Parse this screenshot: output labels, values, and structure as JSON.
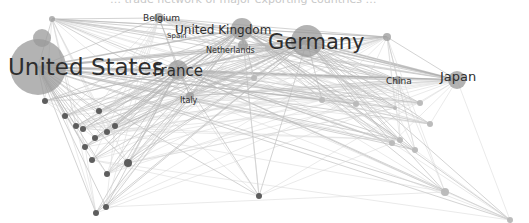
{
  "title_fragment": "… trade network of major exporting countries …",
  "colors": {
    "edge": "#b5b5b5",
    "node_major": "#9a9a9a",
    "node_dark": "#555555",
    "node_light": "#b8b8b8",
    "label": "#2e2e2e"
  },
  "labels": [
    {
      "id": "united-states",
      "text": "United States",
      "x": 8,
      "y": 56,
      "size": 23
    },
    {
      "id": "germany",
      "text": "Germany",
      "x": 268,
      "y": 32,
      "size": 21
    },
    {
      "id": "france",
      "text": "France",
      "x": 153,
      "y": 64,
      "size": 15
    },
    {
      "id": "united-kingdom",
      "text": "United Kingdom",
      "x": 175,
      "y": 24,
      "size": 12
    },
    {
      "id": "japan",
      "text": "Japan",
      "x": 440,
      "y": 70,
      "size": 13
    },
    {
      "id": "belgium",
      "text": "Belgium",
      "x": 143,
      "y": 14,
      "size": 9
    },
    {
      "id": "spain",
      "text": "Spain",
      "x": 167,
      "y": 33,
      "size": 7
    },
    {
      "id": "netherlands",
      "text": "Netherlands",
      "x": 206,
      "y": 47,
      "size": 8
    },
    {
      "id": "china",
      "text": "China",
      "x": 386,
      "y": 77,
      "size": 9
    },
    {
      "id": "italy",
      "text": "Italy",
      "x": 180,
      "y": 97,
      "size": 8
    }
  ],
  "nodes": [
    {
      "id": "united-states",
      "x": 38,
      "y": 67,
      "r": 28,
      "tone": "major"
    },
    {
      "id": "us-blob",
      "x": 42,
      "y": 38,
      "r": 9,
      "tone": "major"
    },
    {
      "id": "germany",
      "x": 307,
      "y": 41,
      "r": 16,
      "tone": "major"
    },
    {
      "id": "france",
      "x": 178,
      "y": 70,
      "r": 10,
      "tone": "major"
    },
    {
      "id": "united-kingdom",
      "x": 242,
      "y": 29,
      "r": 11,
      "tone": "major"
    },
    {
      "id": "japan",
      "x": 457,
      "y": 80,
      "r": 9,
      "tone": "major"
    },
    {
      "id": "belgium",
      "x": 159,
      "y": 18,
      "r": 5,
      "tone": "major"
    },
    {
      "id": "netherlands",
      "x": 243,
      "y": 45,
      "r": 5,
      "tone": "major"
    },
    {
      "id": "china",
      "x": 398,
      "y": 80,
      "r": 4,
      "tone": "major"
    },
    {
      "id": "italy",
      "x": 190,
      "y": 96,
      "r": 4,
      "tone": "major"
    },
    {
      "id": "n-top-right",
      "x": 387,
      "y": 37,
      "r": 4,
      "tone": "major"
    },
    {
      "id": "n-topleft",
      "x": 52,
      "y": 19,
      "r": 3,
      "tone": "major"
    },
    {
      "id": "n-a",
      "x": 45,
      "y": 101,
      "r": 3,
      "tone": "dark"
    },
    {
      "id": "n-b",
      "x": 65,
      "y": 116,
      "r": 3,
      "tone": "dark"
    },
    {
      "id": "n-c",
      "x": 76,
      "y": 126,
      "r": 3,
      "tone": "dark"
    },
    {
      "id": "n-d",
      "x": 83,
      "y": 129,
      "r": 3,
      "tone": "dark"
    },
    {
      "id": "n-e",
      "x": 99,
      "y": 111,
      "r": 3,
      "tone": "dark"
    },
    {
      "id": "n-f",
      "x": 115,
      "y": 126,
      "r": 3,
      "tone": "dark"
    },
    {
      "id": "n-g",
      "x": 107,
      "y": 132,
      "r": 3,
      "tone": "dark"
    },
    {
      "id": "n-h",
      "x": 95,
      "y": 138,
      "r": 3,
      "tone": "dark"
    },
    {
      "id": "n-i",
      "x": 85,
      "y": 147,
      "r": 3,
      "tone": "dark"
    },
    {
      "id": "n-j",
      "x": 92,
      "y": 160,
      "r": 3,
      "tone": "dark"
    },
    {
      "id": "n-k",
      "x": 128,
      "y": 163,
      "r": 4,
      "tone": "dark"
    },
    {
      "id": "n-l",
      "x": 107,
      "y": 174,
      "r": 3,
      "tone": "dark"
    },
    {
      "id": "n-m",
      "x": 96,
      "y": 213,
      "r": 3,
      "tone": "dark"
    },
    {
      "id": "n-n",
      "x": 106,
      "y": 207,
      "r": 3,
      "tone": "dark"
    },
    {
      "id": "n-o",
      "x": 259,
      "y": 196,
      "r": 3,
      "tone": "dark"
    },
    {
      "id": "n-p",
      "x": 445,
      "y": 192,
      "r": 4,
      "tone": "light"
    },
    {
      "id": "n-q",
      "x": 510,
      "y": 220,
      "r": 3,
      "tone": "light"
    },
    {
      "id": "n-r",
      "x": 415,
      "y": 150,
      "r": 3,
      "tone": "light"
    },
    {
      "id": "n-s",
      "x": 430,
      "y": 124,
      "r": 3,
      "tone": "light"
    },
    {
      "id": "n-t",
      "x": 400,
      "y": 140,
      "r": 3,
      "tone": "light"
    },
    {
      "id": "n-u",
      "x": 420,
      "y": 103,
      "r": 3,
      "tone": "light"
    },
    {
      "id": "n-v",
      "x": 395,
      "y": 108,
      "r": 2,
      "tone": "light"
    },
    {
      "id": "n-w",
      "x": 392,
      "y": 143,
      "r": 3,
      "tone": "light"
    },
    {
      "id": "n-x",
      "x": 322,
      "y": 100,
      "r": 3,
      "tone": "light"
    },
    {
      "id": "n-y",
      "x": 268,
      "y": 48,
      "r": 3,
      "tone": "light"
    },
    {
      "id": "n-z",
      "x": 356,
      "y": 104,
      "r": 3,
      "tone": "light"
    },
    {
      "id": "n-aa",
      "x": 254,
      "y": 78,
      "r": 3,
      "tone": "light"
    }
  ]
}
